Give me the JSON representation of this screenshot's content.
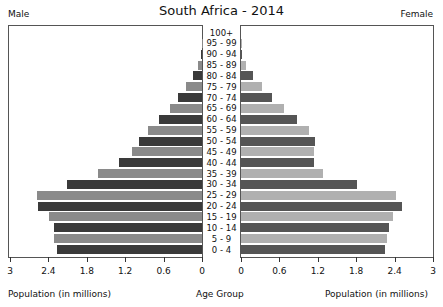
{
  "chart_data": {
    "type": "bar",
    "subtype": "population-pyramid",
    "title": "South Africa - 2014",
    "left_label": "Male",
    "right_label": "Female",
    "xlabel_left": "Population (in millions)",
    "xlabel_center": "Age Group",
    "xlabel_right": "Population (in millions)",
    "xlim": [
      0,
      3
    ],
    "left_ticks": [
      "3",
      "2.4",
      "1.8",
      "1.2",
      "0.6",
      "0"
    ],
    "right_ticks": [
      "0",
      "0.6",
      "1.2",
      "1.8",
      "2.4",
      "3"
    ],
    "categories": [
      "100+",
      "95 - 99",
      "90 - 94",
      "85 - 89",
      "80 - 84",
      "75 - 79",
      "70 - 74",
      "65 - 69",
      "60 - 64",
      "55 - 59",
      "50 - 54",
      "45 - 49",
      "40 - 44",
      "35 - 39",
      "30 - 34",
      "25 - 29",
      "20 - 24",
      "15 - 19",
      "10 - 14",
      "5 - 9",
      "0 - 4"
    ],
    "series": [
      {
        "name": "Male",
        "values": [
          0.0,
          0.005,
          0.02,
          0.06,
          0.14,
          0.25,
          0.37,
          0.5,
          0.67,
          0.84,
          0.98,
          1.09,
          1.3,
          1.63,
          2.11,
          2.58,
          2.56,
          2.39,
          2.31,
          2.31,
          2.27
        ]
      },
      {
        "name": "Female",
        "values": [
          0.0,
          0.01,
          0.02,
          0.08,
          0.19,
          0.33,
          0.48,
          0.67,
          0.88,
          1.06,
          1.16,
          1.14,
          1.14,
          1.28,
          1.81,
          2.42,
          2.52,
          2.37,
          2.31,
          2.28,
          2.25
        ]
      }
    ],
    "colors": {
      "dark": "#3a3a3a",
      "light": "#8a8a8a",
      "female_dark": "#555555",
      "female_light": "#b0b0b0"
    }
  }
}
